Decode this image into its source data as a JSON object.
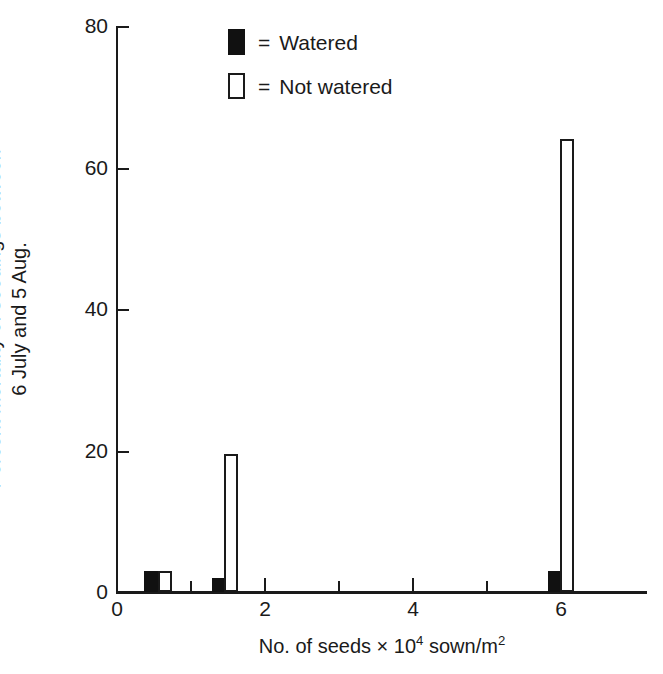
{
  "chart_data": {
    "type": "bar",
    "title": "",
    "xlabel": "No. of seeds × 10⁴ sown/m²",
    "ylabel": "Percent mortality of seedings between 6 July and 5 Aug.",
    "xlim": [
      0,
      6.6
    ],
    "ylim": [
      0,
      80
    ],
    "grid": false,
    "legend_position": "top-center",
    "x_major_ticks": [
      0,
      2,
      4,
      6
    ],
    "x_minor_ticks": [
      1,
      3,
      5
    ],
    "y_ticks": [
      0,
      20,
      40,
      60,
      80
    ],
    "series": [
      {
        "name": "Watered",
        "style": "filled",
        "values": [
          3,
          2,
          3
        ],
        "x": [
          0.45,
          1.37,
          5.9
        ]
      },
      {
        "name": "Not watered",
        "style": "open",
        "values": [
          3,
          19.5,
          64
        ],
        "x": [
          0.63,
          1.55,
          6.05
        ]
      }
    ],
    "bars": [
      {
        "id": "bar-watered-g1",
        "series": "Watered",
        "style": "filled",
        "x_start": 0.36,
        "x_end": 0.56,
        "value": 3
      },
      {
        "id": "bar-notwatered-g1",
        "series": "Not watered",
        "style": "open",
        "x_start": 0.56,
        "x_end": 0.75,
        "value": 3
      },
      {
        "id": "bar-watered-g2",
        "series": "Watered",
        "style": "filled",
        "x_start": 1.28,
        "x_end": 1.45,
        "value": 2
      },
      {
        "id": "bar-notwatered-g2",
        "series": "Not watered",
        "style": "open",
        "x_start": 1.45,
        "x_end": 1.64,
        "value": 19.5
      },
      {
        "id": "bar-watered-g3",
        "series": "Watered",
        "style": "filled",
        "x_start": 5.82,
        "x_end": 5.99,
        "value": 3
      },
      {
        "id": "bar-notwatered-g3",
        "series": "Not watered",
        "style": "open",
        "x_start": 5.99,
        "x_end": 6.17,
        "value": 64
      }
    ]
  },
  "axes": {
    "y_tick_labels": [
      "0",
      "20",
      "40",
      "60",
      "80"
    ],
    "x_tick_labels": [
      "0",
      "2",
      "4",
      "6"
    ],
    "y_title_line1": "Percent mortality of seedings between",
    "y_title_line2": "6 July and 5 Aug.",
    "x_title_prefix": "No. of seeds × 10",
    "x_title_exp1": "4",
    "x_title_mid": " sown/m",
    "x_title_exp2": "2"
  },
  "legend": {
    "items": [
      {
        "equals": "=",
        "label": "Watered",
        "style": "filled",
        "color": "#111111"
      },
      {
        "equals": "=",
        "label": "Not watered",
        "style": "open",
        "color": "#ffffff"
      }
    ]
  },
  "colors": {
    "ink": "#1a1a1a",
    "fill": "#111111",
    "background": "#ffffff"
  }
}
